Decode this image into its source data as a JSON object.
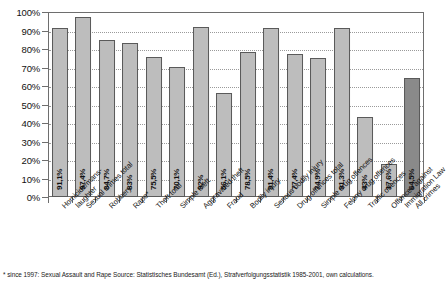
{
  "chart_data": {
    "type": "bar",
    "title": "",
    "subtitle": "",
    "xlabel": "",
    "ylabel": "",
    "ylim": [
      0,
      100
    ],
    "grid": true,
    "legend": "none",
    "y_tick_labels": [
      "100%",
      "90%",
      "80%",
      "70%",
      "60%",
      "50%",
      "40%",
      "30%",
      "20%",
      "10%",
      "0%"
    ],
    "y_ticks": [
      100,
      90,
      80,
      70,
      60,
      50,
      40,
      30,
      20,
      10,
      0
    ],
    "categories": [
      "Homicide/manslaughter",
      "Sexual crimes total",
      "Robbery",
      "Rape*",
      "Theft total",
      "Simple theft",
      "Aggravated theft",
      "Fraud",
      "Bodily injury",
      "Serious bodily injury",
      "Drug offences total",
      "Simple drug offences",
      "Felony drug offences",
      "Traffic offences",
      "Offences against Immigration Law",
      "All crimes"
    ],
    "category_lines": [
      [
        "Homicide/mans-",
        "laughter"
      ],
      [
        "Sexual crimes total"
      ],
      [
        "Robbery"
      ],
      [
        "Rape*"
      ],
      [
        "Theft total"
      ],
      [
        "Simple theft"
      ],
      [
        "Aggravated theft"
      ],
      [
        "Fraud"
      ],
      [
        "Bodily injury"
      ],
      [
        "Serious bodily injury"
      ],
      [
        "Drug offences total"
      ],
      [
        "Simple drug offences"
      ],
      [
        "Felony drug offences"
      ],
      [
        "Traffic offences"
      ],
      [
        "Offences against",
        "Immigration Law"
      ],
      [
        "All crimes"
      ]
    ],
    "values": [
      91.1,
      97.4,
      84.7,
      83.0,
      75.5,
      70.1,
      92.0,
      56.1,
      78.5,
      91.4,
      77.4,
      74.9,
      91.3,
      43.0,
      17.6,
      64.5
    ],
    "value_labels": [
      "91,1%",
      "97,4%",
      "84,7%",
      "83%",
      "75,5%",
      "70,1%",
      "92%",
      "56,1%",
      "78,5%",
      "91,4%",
      "77,4%",
      "74,9%",
      "91,3%",
      "43%",
      "17,6%",
      "64,5%"
    ],
    "bar_colors": [
      "#bdbdbd",
      "#bdbdbd",
      "#bdbdbd",
      "#bdbdbd",
      "#bdbdbd",
      "#bdbdbd",
      "#bdbdbd",
      "#bdbdbd",
      "#bdbdbd",
      "#bdbdbd",
      "#bdbdbd",
      "#bdbdbd",
      "#bdbdbd",
      "#bdbdbd",
      "#bdbdbd",
      "#8a8a8a"
    ],
    "highlight_index": 15,
    "colors": {
      "bar_fill": "#bdbdbd",
      "bar_fill_highlight": "#8a8a8a",
      "bar_stroke": "#5a5a5a",
      "axis": "#6e6e6e",
      "grid": "#9a9a9a",
      "text": "#111111",
      "background": "#ffffff"
    }
  },
  "footnote": {
    "text": "* since 1997: Sexual Assault and Rape Source: Statistisches Bundesamt (Ed.), Strafverfolgungsstatistik 1985-2001, own calculations."
  }
}
